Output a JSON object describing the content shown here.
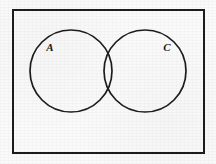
{
  "figure": {
    "kind": "venn-diagram",
    "width": 216,
    "height": 164,
    "background_color": "#fafafa",
    "ink_color": "#1c1c1c"
  },
  "universe_box": {
    "name": "universal-set-rectangle",
    "x": 12,
    "y": 9,
    "width": 193,
    "height": 145,
    "stroke_width": 2,
    "stroke_color": "#1c1c1c",
    "fill": "none"
  },
  "sets": [
    {
      "id": "set-a",
      "label": "A",
      "cx": 71,
      "cy": 71,
      "r": 41,
      "stroke_width": 1.6,
      "stroke_color": "#1c1c1c",
      "fill": "none",
      "label_x": 50,
      "label_y": 48
    },
    {
      "id": "set-c",
      "label": "C",
      "cx": 145,
      "cy": 71,
      "r": 41,
      "stroke_width": 1.6,
      "stroke_color": "#1c1c1c",
      "fill": "none",
      "label_x": 167,
      "label_y": 48
    }
  ],
  "overlap": {
    "name": "intersection-region",
    "label": "",
    "left_x": 104,
    "right_x": 112
  }
}
